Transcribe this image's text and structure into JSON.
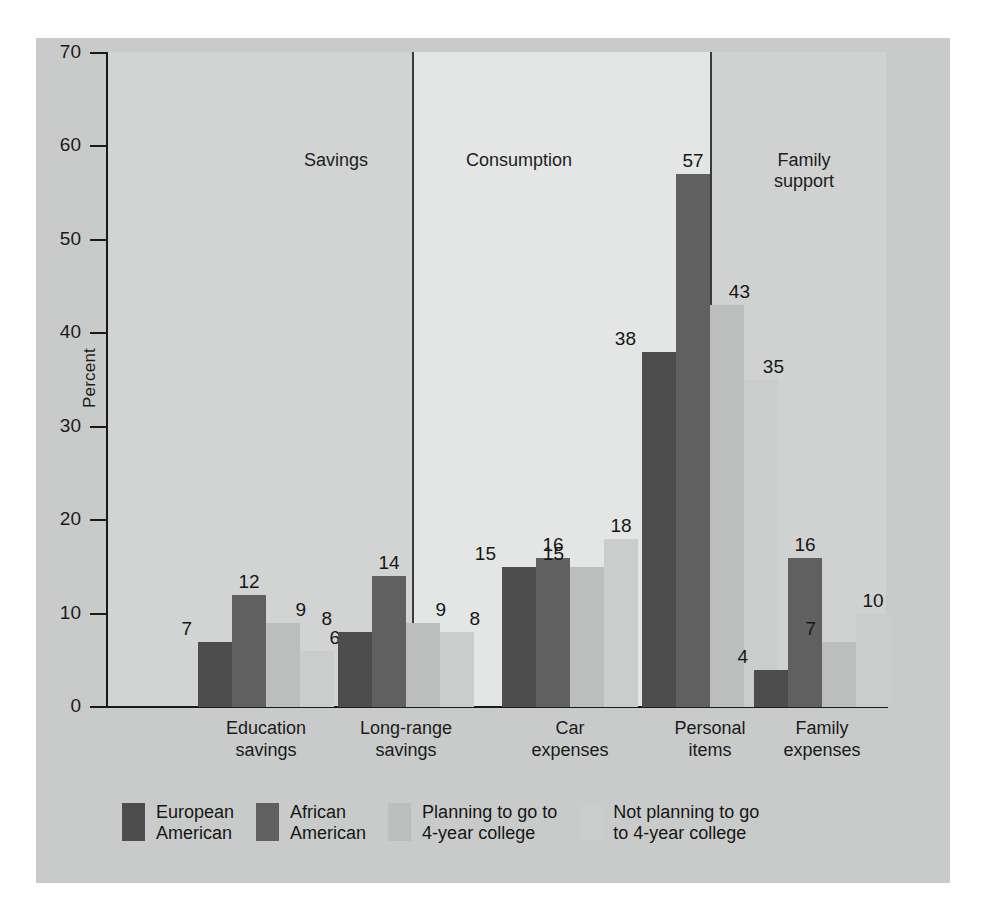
{
  "axis": {
    "y_label": "Percent",
    "y_ticks": [
      "0",
      "10",
      "20",
      "30",
      "40",
      "50",
      "60",
      "70"
    ]
  },
  "panels": [
    {
      "title": "Savings"
    },
    {
      "title": "Consumption"
    },
    {
      "title": "Family\nsupport"
    }
  ],
  "legend": [
    {
      "label": "European\nAmerican",
      "color": "#4d4d4d"
    },
    {
      "label": "African\nAmerican",
      "color": "#606060"
    },
    {
      "label": "Planning to go to\n4-year college",
      "color": "#bcbebe"
    },
    {
      "label": "Not planning to go\nto 4-year college",
      "color": "#cbcdcd"
    }
  ],
  "chart_data": {
    "type": "bar",
    "title": "",
    "xlabel": "",
    "ylabel": "Percent",
    "ylim": [
      0,
      70
    ],
    "ytick_step": 10,
    "grid": false,
    "legend_position": "bottom",
    "panels": [
      "Savings",
      "Consumption",
      "Family support"
    ],
    "categories": [
      "Education savings",
      "Long-range savings",
      "Car expenses",
      "Personal items",
      "Family expenses"
    ],
    "category_labels": [
      "Education\nsavings",
      "Long-range\nsavings",
      "Car\nexpenses",
      "Personal\nitems",
      "Family\nexpenses"
    ],
    "category_panel": [
      0,
      0,
      1,
      1,
      2
    ],
    "series": [
      {
        "name": "European American",
        "color": "#4d4d4d",
        "values": [
          7,
          8,
          15,
          38,
          4
        ]
      },
      {
        "name": "African American",
        "color": "#606060",
        "values": [
          12,
          14,
          16,
          57,
          16
        ]
      },
      {
        "name": "Planning to go to 4-year college",
        "color": "#bcbebe",
        "values": [
          9,
          9,
          15,
          43,
          7
        ]
      },
      {
        "name": "Not planning to go to 4-year college",
        "color": "#cbcdcd",
        "values": [
          6,
          8,
          18,
          35,
          10
        ]
      }
    ]
  }
}
